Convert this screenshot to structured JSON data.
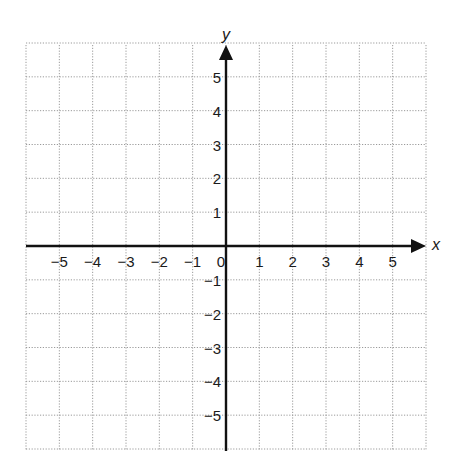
{
  "chart_data": {
    "type": "coordinate-plane",
    "title": "",
    "xlabel": "x",
    "ylabel": "y",
    "xlim": [
      -6,
      6
    ],
    "ylim": [
      -6,
      6
    ],
    "grid": true,
    "grid_style": "dotted",
    "x_ticks": [
      -5,
      -4,
      -3,
      -2,
      -1,
      0,
      1,
      2,
      3,
      4,
      5
    ],
    "y_ticks": [
      -5,
      -4,
      -3,
      -2,
      -1,
      1,
      2,
      3,
      4,
      5
    ],
    "x_tick_labels": [
      "−5",
      "−4",
      "−3",
      "−2",
      "−1",
      "0",
      "1",
      "2",
      "3",
      "4",
      "5"
    ],
    "y_tick_labels": [
      "−5",
      "−4",
      "−3",
      "−2",
      "−1",
      "1",
      "2",
      "3",
      "4",
      "5"
    ],
    "series": []
  },
  "colors": {
    "axis": "#111111",
    "grid": "#9a9a9a",
    "background": "#ffffff"
  }
}
